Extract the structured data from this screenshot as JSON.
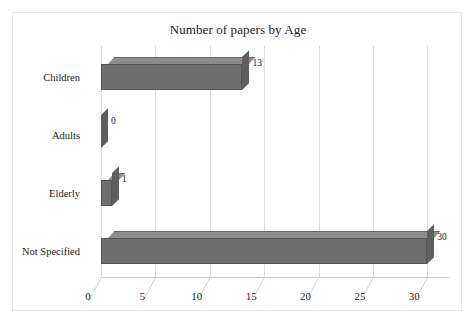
{
  "chart_data": {
    "type": "bar",
    "orientation": "horizontal",
    "title": "Number of papers by Age",
    "xlabel": "",
    "ylabel": "",
    "categories": [
      "Children",
      "Adults",
      "Elderly",
      "Not Specified"
    ],
    "values": [
      13,
      0,
      1,
      30
    ],
    "value_labels": [
      "13",
      "0",
      "1",
      "30"
    ],
    "xlim": [
      0,
      32
    ],
    "xticks": [
      0,
      5,
      10,
      15,
      20,
      25,
      30
    ],
    "xtick_labels": [
      "0",
      "5",
      "10",
      "15",
      "20",
      "25",
      "30"
    ],
    "grid": true,
    "grid_axis": "x",
    "legend": false,
    "style": "3d",
    "series": [
      {
        "name": "Number of papers",
        "values": [
          13,
          0,
          1,
          30
        ]
      }
    ],
    "colors": {
      "bar_front": "#6e6e6e",
      "bar_top": "#8d8d8d",
      "bar_side": "#5e5e5e",
      "gridline": "#dcdcdc",
      "axis": "#c9c9c9",
      "text": "#1a1a1a",
      "background": "#ffffff",
      "frame_border": "#e9e9e9"
    }
  }
}
